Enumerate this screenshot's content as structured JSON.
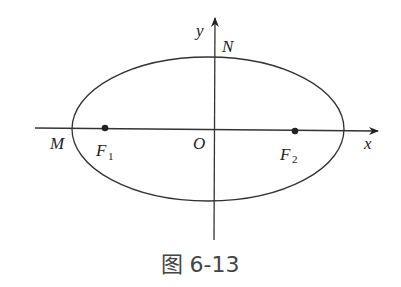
{
  "figure": {
    "caption": "图 6-13",
    "type": "ellipse with foci on x-axis",
    "labels": {
      "x_axis": "x",
      "y_axis": "y",
      "origin": "O",
      "vertex_left": "M",
      "vertex_top": "N",
      "focus_left": "F",
      "focus_left_sub": "1",
      "focus_right": "F",
      "focus_right_sub": "2"
    }
  }
}
